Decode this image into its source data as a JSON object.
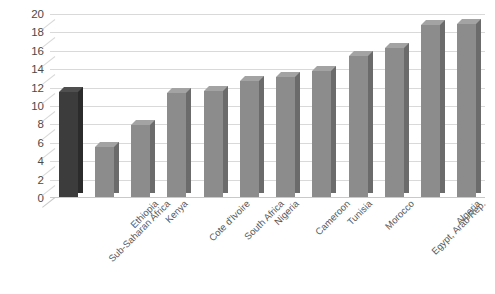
{
  "chart_data": {
    "type": "bar",
    "title": "",
    "subtitle": "",
    "xlabel": "",
    "ylabel": "",
    "ylim": [
      0,
      20
    ],
    "ytick_step": 2,
    "yticks": [
      20,
      18,
      16,
      14,
      12,
      10,
      8,
      6,
      4,
      2,
      0
    ],
    "grid": true,
    "legend": "none",
    "style": "3d-column",
    "categories": [
      "Sub-Saharan Africa",
      "Ethiopia",
      "Kenya",
      "Cote d'Ivoire",
      "South Africa",
      "Nigeria",
      "Cameroon",
      "Tunisia",
      "Morocco",
      "Egypt, Arab Rep.",
      "Algeria",
      "Congo, Dem. Rep."
    ],
    "values": [
      11.5,
      5.5,
      7.9,
      11.4,
      11.6,
      12.7,
      13.1,
      13.8,
      15.4,
      16.3,
      18.8,
      18.9
    ],
    "highlight_index": 0,
    "colors": {
      "bar": "#8c8c8c",
      "bar_side": "#6b6b6b",
      "bar_top": "#a3a3a3",
      "bar_highlight": "#3c3c3c",
      "bar_highlight_side": "#2b2b2b",
      "bar_highlight_top": "#4f4f4f",
      "gridline": "#d9d9d9",
      "axis_text": "#4a4a4a",
      "category_text": "#595959",
      "background": "#ffffff"
    }
  },
  "footer": {
    "caption": ""
  }
}
